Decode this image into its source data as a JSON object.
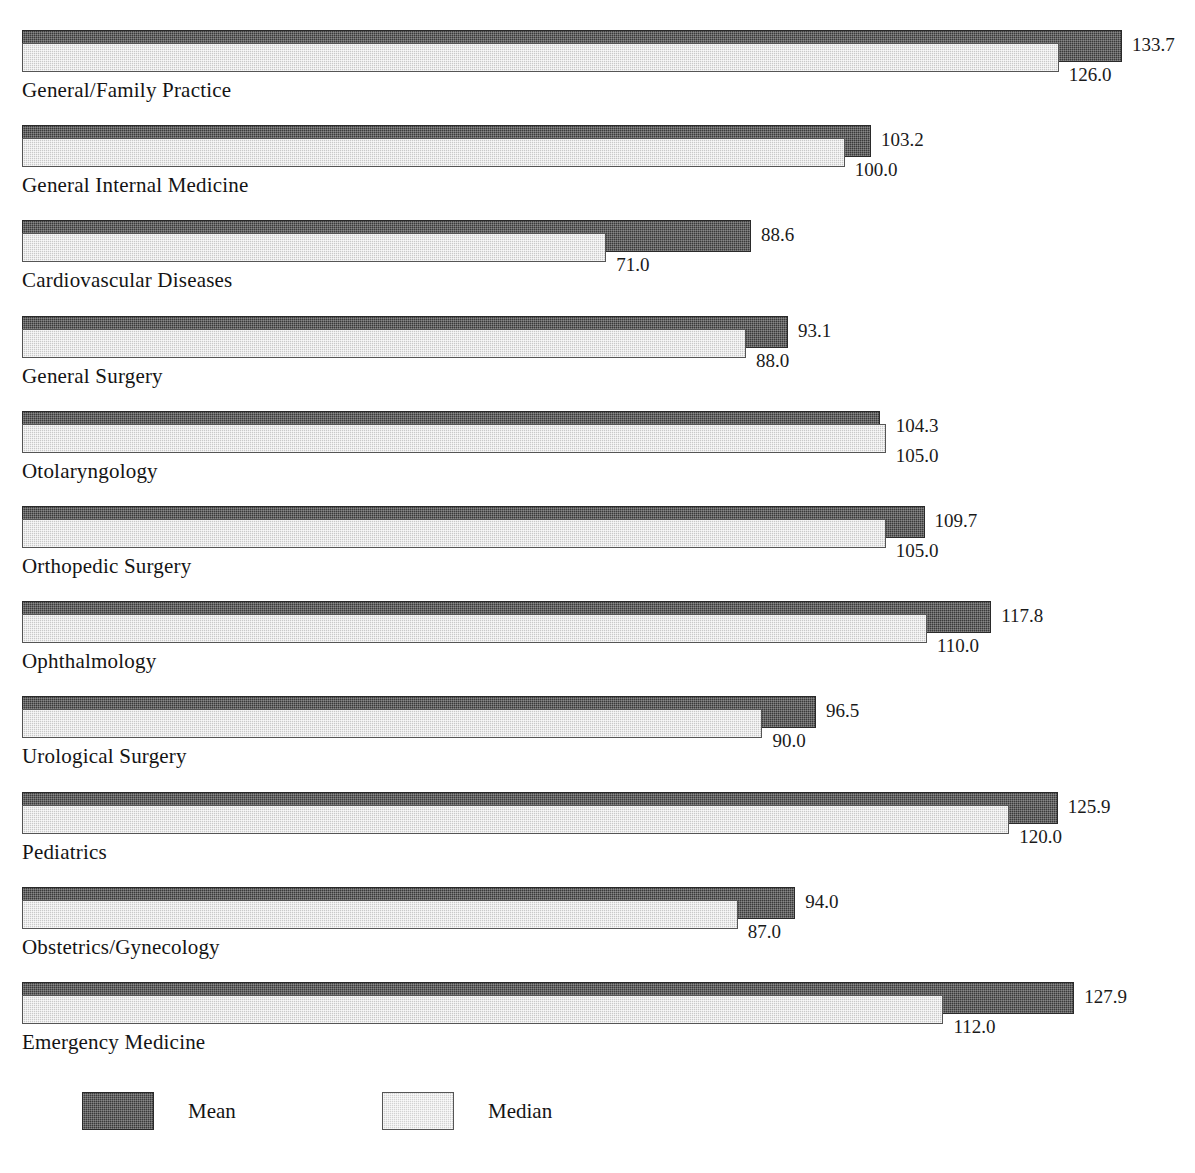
{
  "chart_data": {
    "type": "bar",
    "orientation": "horizontal",
    "title": "",
    "xlabel": "",
    "ylabel": "",
    "xlim": [
      0,
      133.7
    ],
    "grid": false,
    "legend_position": "bottom-left",
    "bar_origin": 0,
    "categories": [
      "General/Family Practice",
      "General Internal Medicine",
      "Cardiovascular Diseases",
      "General Surgery",
      "Otolaryngology",
      "Orthopedic Surgery",
      "Ophthalmology",
      "Urological Surgery",
      "Pediatrics",
      "Obstetrics/Gynecology",
      "Emergency Medicine"
    ],
    "series": [
      {
        "name": "Mean",
        "color": "#3a3a3a",
        "values": [
          133.7,
          103.2,
          88.6,
          93.1,
          104.3,
          109.7,
          117.8,
          96.5,
          125.9,
          94.0,
          127.9
        ],
        "labels": [
          "133.7",
          "103.2",
          "88.6",
          "93.1",
          "104.3",
          "109.7",
          "117.8",
          "96.5",
          "125.9",
          "94.0",
          "127.9"
        ]
      },
      {
        "name": "Median",
        "color": "#c9c9c9",
        "values": [
          126.0,
          100.0,
          71.0,
          88.0,
          105.0,
          105.0,
          110.0,
          90.0,
          120.0,
          87.0,
          112.0
        ],
        "labels": [
          "126.0",
          "100.0",
          "71.0",
          "88.0",
          "105.0",
          "105.0",
          "110.0",
          "90.0",
          "120.0",
          "87.0",
          "112.0"
        ]
      }
    ]
  },
  "legend": {
    "items": [
      {
        "label": "Mean",
        "swatch": "mean-swatch"
      },
      {
        "label": "Median",
        "swatch": "median-swatch"
      }
    ]
  }
}
